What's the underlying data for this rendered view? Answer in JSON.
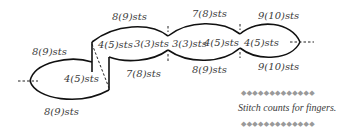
{
  "diagram": {
    "labels": {
      "left_top": "8(9)sts",
      "left_inner": "4(5)sts",
      "left_bottom": "8(9)sts",
      "mid_top": "8(9)sts",
      "mid_inner_left": "4(5)sts",
      "mid_inner_right": "3(3)sts",
      "mid_bottom": "7(8)sts",
      "center_top": "7(8)sts",
      "center_inner_left": "3(3)sts",
      "center_inner_right": "4(5)sts",
      "center_bottom": "8(9)sts",
      "right_top": "9(10)sts",
      "right_inner": "4(5)sts",
      "right_bottom": "9(10)sts"
    },
    "caption": {
      "text": "Stitch counts for fingers.",
      "border_top": "◆◆◆◆◆◆◆◆◆◆◆◆◆",
      "border_bottom": "◆◆◆◆◆◆◆◆◆◆◆◆◆"
    },
    "colors": {
      "line": "#111111",
      "text": "#3a3a3a",
      "ornament": "#9a9a9a"
    }
  }
}
